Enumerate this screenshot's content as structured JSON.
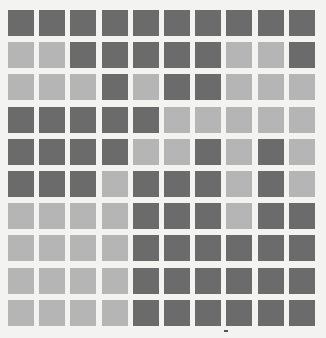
{
  "grid": {
    "rows": 10,
    "cols": 10,
    "colors": {
      "D": "#6b6b6b",
      "L": "#b5b5b5"
    },
    "cells": [
      [
        "D",
        "D",
        "D",
        "D",
        "D",
        "D",
        "D",
        "D",
        "D",
        "D"
      ],
      [
        "L",
        "L",
        "D",
        "D",
        "D",
        "D",
        "D",
        "L",
        "L",
        "D"
      ],
      [
        "L",
        "L",
        "L",
        "D",
        "L",
        "D",
        "D",
        "L",
        "L",
        "L"
      ],
      [
        "D",
        "D",
        "D",
        "D",
        "D",
        "L",
        "L",
        "L",
        "L",
        "L"
      ],
      [
        "D",
        "D",
        "D",
        "D",
        "L",
        "L",
        "D",
        "L",
        "D",
        "L"
      ],
      [
        "D",
        "D",
        "D",
        "L",
        "D",
        "D",
        "D",
        "L",
        "D",
        "L"
      ],
      [
        "L",
        "L",
        "L",
        "L",
        "D",
        "D",
        "D",
        "L",
        "D",
        "D"
      ],
      [
        "L",
        "L",
        "L",
        "L",
        "D",
        "D",
        "D",
        "D",
        "D",
        "D"
      ],
      [
        "L",
        "L",
        "L",
        "L",
        "D",
        "D",
        "D",
        "D",
        "D",
        "D"
      ],
      [
        "L",
        "L",
        "L",
        "L",
        "D",
        "D",
        "D",
        "D",
        "D",
        "D"
      ]
    ]
  }
}
